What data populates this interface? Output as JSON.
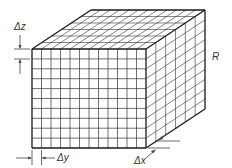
{
  "figure": {
    "type": "3d-grid-block",
    "labels": {
      "dz": "Δz",
      "dy": "Δy",
      "dx": "Δx",
      "region": "R"
    },
    "grid": {
      "front_columns": 12,
      "front_rows": 10,
      "depth_cells": 6
    },
    "colors": {
      "line": "#1a1a1a",
      "grid": "#333333",
      "annotation": "#444444",
      "background": "#ffffff"
    }
  }
}
